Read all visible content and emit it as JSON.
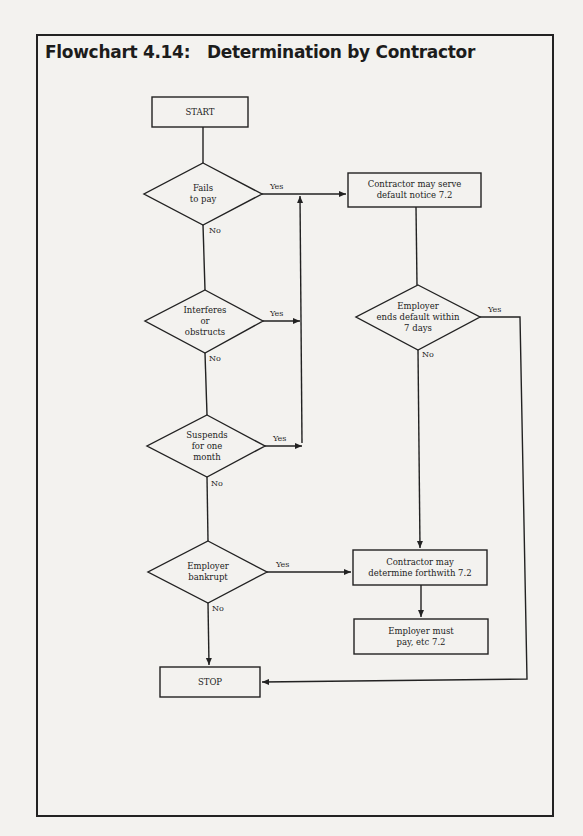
{
  "title": "Flowchart 4.14:   Determination by Contractor",
  "nodes": {
    "start": "START",
    "fails_to_pay": "Fails\nto pay",
    "interferes": "Interferes\nor\nobstructs",
    "suspends": "Suspends\nfor one\nmonth",
    "bankrupt": "Employer\nbankrupt",
    "serve_notice": "Contractor may serve\ndefault notice 7.2",
    "ends_default": "Employer\nends default within\n7 days",
    "determine": "Contractor may\ndetermine forthwith 7.2",
    "must_pay": "Employer must\npay, etc 7.2",
    "stop": "STOP"
  },
  "edge_labels": {
    "yes": "Yes",
    "no": "No"
  },
  "colors": {
    "line": "#222222",
    "paper": "#f3f2ef"
  }
}
